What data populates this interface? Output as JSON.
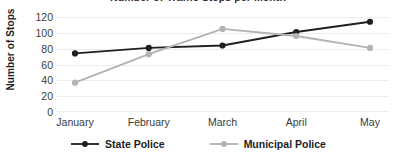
{
  "chart_data": {
    "type": "line",
    "title": "Number of Traffic Stops per Month",
    "xlabel": "",
    "ylabel": "Number of Stops",
    "categories": [
      "January",
      "February",
      "March",
      "April",
      "May"
    ],
    "series": [
      {
        "name": "State Police",
        "color": "#231f20",
        "marker": "circle",
        "values": [
          74,
          81,
          84,
          101,
          114
        ]
      },
      {
        "name": "Municipal Police",
        "color": "#b3b3b3",
        "marker": "circle",
        "values": [
          37,
          73,
          105,
          96,
          81
        ]
      }
    ],
    "ylim": [
      0,
      120
    ],
    "yticks": [
      0,
      20,
      40,
      60,
      80,
      100,
      120
    ],
    "ytick_labels": [
      "0",
      "20",
      "40",
      "60",
      "80",
      "100",
      "120"
    ],
    "grid": true,
    "grid_axis": "y",
    "grid_color": "#ececec",
    "legend_position": "bottom",
    "background": "#ffffff"
  },
  "axes": {
    "y_title": "Number of Stops",
    "y_tick_labels": [
      "120",
      "100",
      "80",
      "60",
      "40",
      "20",
      "0"
    ],
    "x_tick_labels": [
      "January",
      "February",
      "March",
      "April",
      "May"
    ]
  },
  "legend": {
    "items": [
      {
        "label": "State Police",
        "color": "#231f20"
      },
      {
        "label": "Municipal Police",
        "color": "#b3b3b3"
      }
    ]
  },
  "title": "Number of Traffic Stops per Month"
}
